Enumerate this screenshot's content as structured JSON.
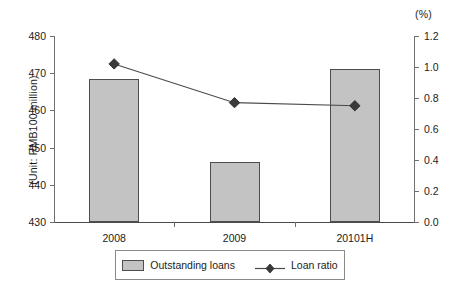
{
  "chart_data": {
    "type": "bar",
    "title": "",
    "subtitle": "",
    "xlabel": "",
    "ylabel": "(Unit: RMB100 million)",
    "y2label": "(%)",
    "categories": [
      "2008",
      "2009",
      "20101H"
    ],
    "series": [
      {
        "name": "Outstanding loans",
        "type": "bar",
        "axis": "left",
        "values": [
          468.5,
          446.0,
          471.2
        ]
      },
      {
        "name": "Loan ratio",
        "type": "line",
        "axis": "right",
        "marker": "diamond",
        "values": [
          1.02,
          0.77,
          0.75
        ]
      }
    ],
    "ylim": [
      430,
      480
    ],
    "y2lim": [
      0.0,
      1.2
    ],
    "yticks": [
      "480",
      "470",
      "460",
      "450",
      "440",
      "430"
    ],
    "ytick_values": [
      480,
      470,
      460,
      450,
      440,
      430
    ],
    "y2ticks": [
      "1.2",
      "1.0",
      "0.8",
      "0.6",
      "0.4",
      "0.2",
      "0.0"
    ],
    "y2tick_values": [
      1.2,
      1.0,
      0.8,
      0.6,
      0.4,
      0.2,
      0.0
    ],
    "grid": false,
    "legend_position": "bottom",
    "legend_entries": [
      "Outstanding loans",
      "Loan ratio"
    ],
    "colors": {
      "bar_fill": "#c3c3c3",
      "bar_border": "#4d4d4d",
      "line": "#4a4a4a",
      "marker": "#3a3a3a",
      "axis": "#6f6f6f",
      "text": "#1c1c1c",
      "background": "#ffffff"
    }
  }
}
